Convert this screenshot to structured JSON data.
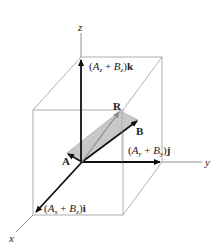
{
  "diagram": {
    "axes": {
      "x": "x",
      "y": "y",
      "z": "z"
    },
    "vectors": {
      "A": "A",
      "B": "B",
      "R": "R"
    },
    "components": {
      "k": {
        "open": "(",
        "a": "A",
        "a_sub": "z",
        "plus": " + ",
        "b": "B",
        "b_sub": "z",
        "close": ")",
        "unit": "k"
      },
      "j": {
        "open": "(",
        "a": "A",
        "a_sub": "y",
        "plus": " + ",
        "b": "B",
        "b_sub": "y",
        "close": ")",
        "unit": "j"
      },
      "i": {
        "open": "(",
        "a": "A",
        "a_sub": "x",
        "plus": " + ",
        "b": "B",
        "b_sub": "x",
        "close": ")",
        "unit": "i"
      }
    },
    "colors": {
      "box_line": "#9a9a9a",
      "vector": "#111111",
      "parallelogram_fill": "#c8c8c8",
      "resultant": "#8a8a8a"
    }
  }
}
